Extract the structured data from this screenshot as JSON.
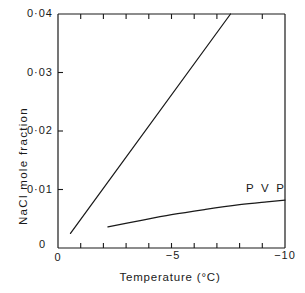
{
  "chart_data": {
    "type": "line",
    "title": "",
    "xlabel": "Temperature  (°C)",
    "ylabel": "NaCl mole fraction",
    "xlim": [
      0,
      -10
    ],
    "ylim": [
      0,
      0.04
    ],
    "xticks": [
      0,
      -5,
      -10
    ],
    "xtick_labels": [
      "0",
      "−5",
      "−10"
    ],
    "x_minor_tick_count": 10,
    "yticks": [
      0,
      0.01,
      0.02,
      0.03,
      0.04
    ],
    "ytick_labels": [
      "0",
      "0·01",
      "0·02",
      "0·03",
      "0·04"
    ],
    "grid": false,
    "legend": "inline-annotation",
    "series": [
      {
        "name": "NaCl",
        "annotation": "",
        "x": [
          -0.55,
          -7.6
        ],
        "y": [
          0.0025,
          0.04
        ]
      },
      {
        "name": "PVP",
        "annotation": "P V P",
        "x": [
          -2.2,
          -3.5,
          -5.0,
          -6.5,
          -8.0,
          -9.2,
          -10.0
        ],
        "y": [
          0.0036,
          0.0046,
          0.0057,
          0.0066,
          0.0074,
          0.0079,
          0.0082
        ]
      }
    ]
  },
  "annotations": {
    "pvp_label": "P V P"
  },
  "axes": {
    "y_title": "NaCl mole fraction",
    "x_title": "Temperature  (°C)",
    "y_labels": [
      "0·04",
      "0·03",
      "0·02",
      "0·01",
      "0"
    ],
    "x_labels": [
      "0",
      "−5",
      "−10"
    ]
  }
}
